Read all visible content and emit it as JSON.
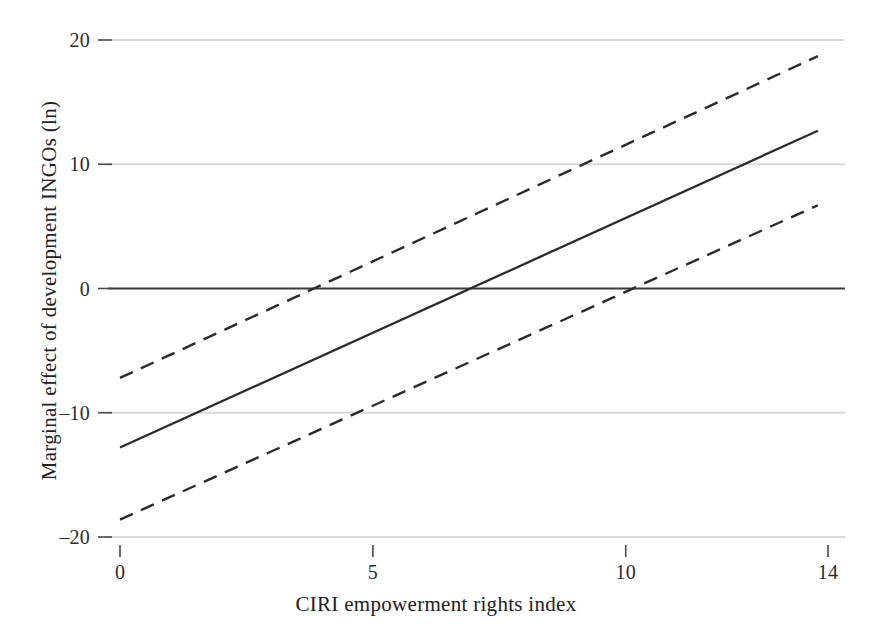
{
  "chart_data": {
    "type": "line",
    "title": "",
    "subtitle": "",
    "xlabel": "CIRI empowerment rights index",
    "ylabel": "Marginal effect of development INGOs (ln)",
    "xlim": [
      0,
      14
    ],
    "ylim": [
      -20,
      20
    ],
    "xticks": [
      0,
      5,
      10,
      14
    ],
    "xticklabels": [
      "0",
      "5",
      "10",
      "14"
    ],
    "yticks": [
      20,
      10,
      0,
      -10,
      -20
    ],
    "yticklabels": [
      "20",
      "10",
      "0",
      "–10",
      "–20"
    ],
    "grid": "horizontal",
    "gridlines_at": [
      20,
      10,
      -10,
      -20
    ],
    "zero_line": 0,
    "legend": "none",
    "annotations": [],
    "x": [
      0,
      14
    ],
    "series": [
      {
        "name": "Marginal effect",
        "style": "solid",
        "color": "#2b2b2b",
        "x": [
          0,
          13.8
        ],
        "values": [
          -12.8,
          12.7
        ],
        "zero_crossing": 7.0
      },
      {
        "name": "Upper 95% confidence bound",
        "style": "dashed",
        "color": "#2b2b2b",
        "x": [
          0,
          13.8
        ],
        "values": [
          -7.2,
          18.7
        ],
        "zero_crossing": 5.4
      },
      {
        "name": "Lower 95% confidence bound",
        "style": "dashed",
        "color": "#2b2b2b",
        "x": [
          0,
          13.8
        ],
        "values": [
          -18.6,
          6.7
        ],
        "zero_crossing": 8.8
      }
    ]
  },
  "axes": {
    "x_title": "CIRI empowerment rights index",
    "y_title": "Marginal effect of development INGOs (ln)",
    "x_tick_labels": [
      "0",
      "5",
      "10",
      "14"
    ],
    "y_tick_labels": [
      "20",
      "10",
      "0",
      "–10",
      "–20"
    ]
  },
  "style": {
    "grid_color": "#d9d9d9",
    "line_color": "#2b2b2b",
    "zero_line_color": "#3a3a3a",
    "background": "#ffffff",
    "text_color": "#222222"
  }
}
